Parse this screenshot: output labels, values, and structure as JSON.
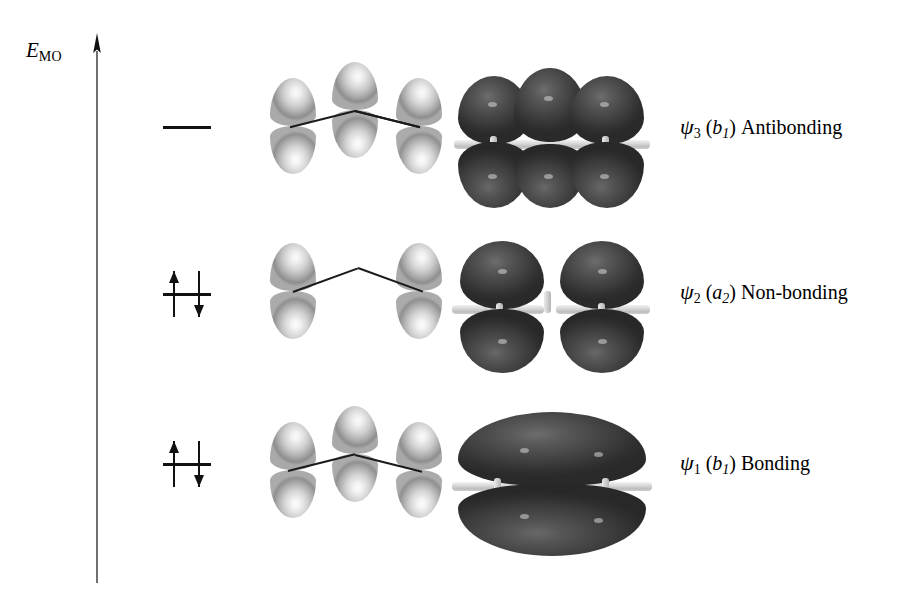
{
  "figure": {
    "type": "molecular-orbital-energy-diagram",
    "axis": {
      "label_symbol": "E",
      "label_subscript": "MO",
      "direction": "upward"
    },
    "levels": [
      {
        "id": "psi3",
        "psi_symbol": "ψ",
        "psi_index": "3",
        "symmetry_open": "(",
        "symmetry_letter": "b",
        "symmetry_sub": "1",
        "symmetry_close": ")",
        "character": "Antibonding",
        "electron_count": 0,
        "electrons": [],
        "lobe_nodes": 2,
        "orbital_lobe_count": 3,
        "surface_lobe_count": 6,
        "relative_energy": "highest"
      },
      {
        "id": "psi2",
        "psi_symbol": "ψ",
        "psi_index": "2",
        "symmetry_open": "(",
        "symmetry_letter": "a",
        "symmetry_sub": "2",
        "symmetry_close": ")",
        "character": "Non-bonding",
        "electron_count": 2,
        "electrons": [
          "up",
          "down"
        ],
        "lobe_nodes": 1,
        "orbital_lobe_count": 2,
        "surface_lobe_count": 4,
        "relative_energy": "middle"
      },
      {
        "id": "psi1",
        "psi_symbol": "ψ",
        "psi_index": "1",
        "symmetry_open": "(",
        "symmetry_letter": "b",
        "symmetry_sub": "1",
        "symmetry_close": ")",
        "character": "Bonding",
        "electron_count": 2,
        "electrons": [
          "up",
          "down"
        ],
        "lobe_nodes": 0,
        "orbital_lobe_count": 3,
        "surface_lobe_count": 2,
        "relative_energy": "lowest"
      }
    ],
    "colors": {
      "background": "#ffffff",
      "ink": "#111111",
      "lobe_light": "#efefef",
      "lobe_shadow": "#8e8e8e",
      "surface_dark": "#3c3c3c",
      "nodal_plane": "#cfcfcf"
    }
  }
}
